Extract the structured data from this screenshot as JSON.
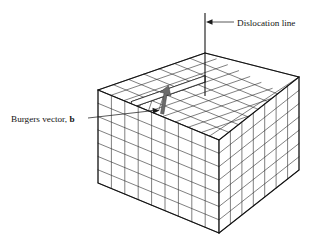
{
  "figure": {
    "background_color": "#ffffff",
    "line_color": "#1b1b1b",
    "accent_color": "#6b6b6b"
  },
  "annotations": {
    "dislocation_line": {
      "label": "Dislocation line",
      "icon": "arrow-left-icon",
      "text_x": 237,
      "text_y": 25,
      "arrow_from_x": 234,
      "arrow_to_x": 208,
      "arrow_y": 22,
      "vline_x": 205,
      "vline_top_y": 13,
      "vline_bottom_y": 96
    },
    "burgers_vector": {
      "label_prefix": "Burgers vector, ",
      "label_symbol": "b",
      "icon": "arrow-up-right-icon",
      "text_x": 11,
      "text_y": 121,
      "leader_from_x": 88,
      "leader_from_y": 118,
      "leader_to_x": 156,
      "leader_to_y": 110,
      "arrow_tip_x": 167,
      "arrow_tip_y": 95,
      "arrow_tail_x": 160,
      "arrow_tail_y": 112
    }
  },
  "lattice": {
    "columns_front": 9,
    "rows_front": 7,
    "columns_right": 7,
    "rows_right": 7,
    "top_grid_u": 9,
    "top_grid_v": 7,
    "step_height_cells": 1,
    "geometry": {
      "left_corner_x": 98,
      "left_corner_y": 90,
      "front_corner_x": 219,
      "front_corner_y": 140,
      "right_corner_x": 299,
      "right_corner_y": 77,
      "back_corner_x": 205,
      "back_corner_y": 53,
      "block_depth_px": 93
    }
  }
}
